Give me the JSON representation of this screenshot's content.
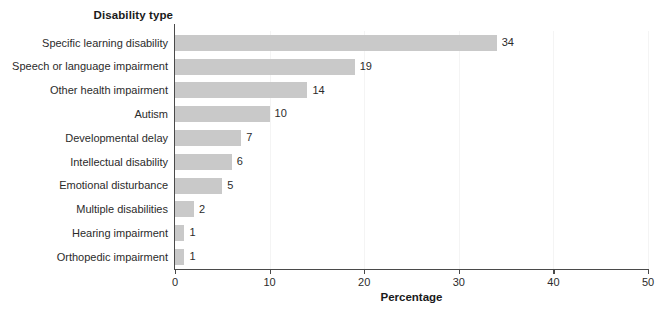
{
  "chart_data": {
    "type": "bar",
    "orientation": "horizontal",
    "title": "",
    "xlabel": "Percentage",
    "ylabel": "Disability type",
    "categories": [
      "Specific learning disability",
      "Speech or language impairment",
      "Other health impairment",
      "Autism",
      "Developmental delay",
      "Intellectual disability",
      "Emotional disturbance",
      "Multiple disabilities",
      "Hearing impairment",
      "Orthopedic impairment"
    ],
    "values": [
      34,
      19,
      14,
      10,
      7,
      6,
      5,
      2,
      1,
      1
    ],
    "data_labels": [
      "34",
      "19",
      "14",
      "10",
      "7",
      "6",
      "5",
      "2",
      "1",
      "1"
    ],
    "xlim": [
      0,
      50
    ],
    "xticks": [
      0,
      10,
      20,
      30,
      40,
      50
    ],
    "xtick_labels": [
      "0",
      "10",
      "20",
      "30",
      "40",
      "50"
    ],
    "grid": true,
    "grid_axis": "x",
    "legend": null,
    "bar_color": "#c9c9c9",
    "axis_color": "#4a4a4a",
    "grid_color": "#f4f4f4",
    "text_color": "#2b2b2b",
    "background": "#ffffff"
  }
}
